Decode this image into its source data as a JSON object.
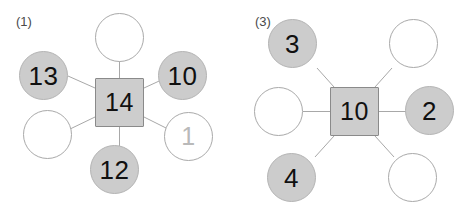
{
  "worksheet": {
    "title": "Number bond spider diagrams worksheet",
    "background_color": "#ffffff",
    "filled_node_color": "#cccccc",
    "empty_node_color": "#ffffff",
    "center_node_color": "#cdcdcd",
    "line_color": "#a8a8a8",
    "text_color": "#101010"
  },
  "problems": [
    {
      "label": "(1)",
      "center": {
        "value": "14",
        "shape": "square",
        "filled": true
      },
      "spokes": [
        {
          "position": "top",
          "value": "",
          "filled": false
        },
        {
          "position": "top-left",
          "value": "13",
          "filled": true
        },
        {
          "position": "top-right",
          "value": "10",
          "filled": true
        },
        {
          "position": "left",
          "value": "",
          "filled": false
        },
        {
          "position": "right",
          "value": "1",
          "filled": false
        },
        {
          "position": "bottom",
          "value": "12",
          "filled": true
        }
      ]
    },
    {
      "label": "(3)",
      "center": {
        "value": "10",
        "shape": "square",
        "filled": true
      },
      "spokes": [
        {
          "position": "top-left",
          "value": "3",
          "filled": true
        },
        {
          "position": "top-right",
          "value": "",
          "filled": false
        },
        {
          "position": "left",
          "value": "",
          "filled": false
        },
        {
          "position": "right",
          "value": "2",
          "filled": true
        },
        {
          "position": "bottom-left",
          "value": "4",
          "filled": true
        },
        {
          "position": "bottom-right",
          "value": "",
          "filled": false
        }
      ]
    }
  ]
}
